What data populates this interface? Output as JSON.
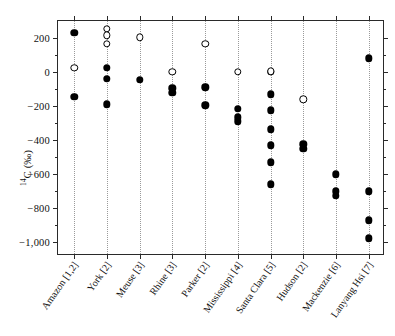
{
  "chart_data": {
    "type": "scatter",
    "title": "",
    "xlabel": "",
    "ylabel": "14C (‰)",
    "ylabel_parts": {
      "sup": "14",
      "rest": "C (‰)"
    },
    "ylim": [
      -1080,
      300
    ],
    "yticks": [
      200,
      0,
      -200,
      -400,
      -600,
      -800,
      -1000
    ],
    "ytick_labels": [
      "200",
      "0",
      "−200",
      "−400",
      "−600",
      "−800",
      "−1,000"
    ],
    "yminor_step": 100,
    "grid": "vertical dotted per category",
    "legend": "none",
    "marker_types": [
      "filled circle",
      "open circle"
    ],
    "categories": [
      "Amazon [1,2]",
      "York [2]",
      "Meuse [3]",
      "Rhine [3]",
      "Parker [2]",
      "Mississippi [4]",
      "Santa Clara [5]",
      "Hudson [2]",
      "Mackenzie [6]",
      "Lanyang Hsi [7]"
    ],
    "series": [
      {
        "name": "filled",
        "marker": "filled",
        "points": [
          {
            "category": "Amazon [1,2]",
            "x": 1,
            "values": [
              230,
              -145
            ]
          },
          {
            "category": "York [2]",
            "x": 2,
            "values": [
              25,
              -40,
              -190
            ]
          },
          {
            "category": "Meuse [3]",
            "x": 3,
            "values": [
              -45
            ]
          },
          {
            "category": "Rhine [3]",
            "x": 4,
            "values": [
              -95,
              -120
            ]
          },
          {
            "category": "Parker [2]",
            "x": 5,
            "values": [
              -90,
              -195
            ]
          },
          {
            "category": "Mississippi [4]",
            "x": 6,
            "values": [
              -215,
              -265,
              -290
            ]
          },
          {
            "category": "Santa Clara [5]",
            "x": 7,
            "values": [
              0,
              -130,
              -225,
              -335,
              -430,
              -530,
              -660
            ]
          },
          {
            "category": "Hudson [2]",
            "x": 8,
            "values": [
              -425,
              -450
            ]
          },
          {
            "category": "Mackenzie [6]",
            "x": 9,
            "values": [
              -600,
              -700,
              -725
            ]
          },
          {
            "category": "Lanyang Hsi [7]",
            "x": 10,
            "values": [
              80,
              -700,
              -870,
              -975
            ]
          }
        ]
      },
      {
        "name": "open",
        "marker": "open",
        "points": [
          {
            "category": "Amazon [1,2]",
            "x": 1,
            "values": [
              25
            ]
          },
          {
            "category": "York [2]",
            "x": 2,
            "values": [
              255,
              215,
              165
            ]
          },
          {
            "category": "Meuse [3]",
            "x": 3,
            "values": [
              205
            ]
          },
          {
            "category": "Rhine [3]",
            "x": 4,
            "values": [
              0
            ]
          },
          {
            "category": "Parker [2]",
            "x": 5,
            "values": [
              165
            ]
          },
          {
            "category": "Mississippi [4]",
            "x": 6,
            "values": [
              0
            ]
          },
          {
            "category": "Santa Clara [5]",
            "x": 7,
            "values": [
              5
            ]
          },
          {
            "category": "Hudson [2]",
            "x": 8,
            "values": [
              -160
            ]
          },
          {
            "category": "Mackenzie [6]",
            "x": 9,
            "values": []
          },
          {
            "category": "Lanyang Hsi [7]",
            "x": 10,
            "values": []
          }
        ]
      }
    ]
  }
}
